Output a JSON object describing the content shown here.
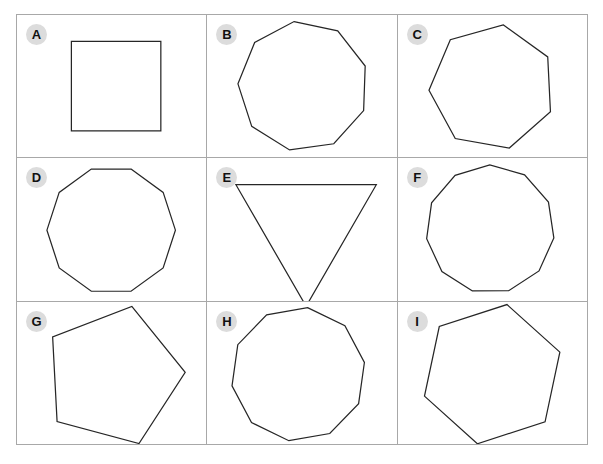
{
  "header": {
    "clipped_text": ""
  },
  "grid": {
    "columns": 3,
    "rows": 3,
    "border_color": "#a8a8a8",
    "background_color": "#ffffff",
    "badge_background_color": "#dcdcdc",
    "badge_text_color": "#111111",
    "shape_stroke_color": "#262626"
  },
  "cells": [
    {
      "label": "A",
      "shape_name": "square",
      "sides": 4,
      "rotation_deg": 45,
      "center": [
        100,
        72
      ],
      "radius": 64
    },
    {
      "label": "B",
      "shape_name": "nonagon",
      "sides": 9,
      "rotation_deg": -8,
      "center": [
        97,
        72
      ],
      "radius": 66
    },
    {
      "label": "C",
      "shape_name": "heptagon",
      "sides": 7,
      "rotation_deg": 10,
      "center": [
        95,
        73
      ],
      "radius": 64
    },
    {
      "label": "D",
      "shape_name": "decagon",
      "sides": 10,
      "rotation_deg": 18,
      "center": [
        95,
        73
      ],
      "radius": 65
    },
    {
      "label": "E",
      "shape_name": "triangle",
      "sides": 3,
      "rotation_deg": 180,
      "center": [
        100,
        68
      ],
      "radius": 82
    },
    {
      "label": "F",
      "shape_name": "hendecagon",
      "sides": 11,
      "rotation_deg": 196,
      "center": [
        93,
        72
      ],
      "radius": 65
    },
    {
      "label": "G",
      "shape_name": "pentagon",
      "sides": 5,
      "rotation_deg": 15,
      "center": [
        97,
        75
      ],
      "radius": 73
    },
    {
      "label": "H",
      "shape_name": "decagon",
      "sides": 10,
      "rotation_deg": 8,
      "center": [
        92,
        73
      ],
      "radius": 68
    },
    {
      "label": "I",
      "shape_name": "hexagon",
      "sides": 6,
      "rotation_deg": 12,
      "center": [
        95,
        73
      ],
      "radius": 72
    }
  ]
}
